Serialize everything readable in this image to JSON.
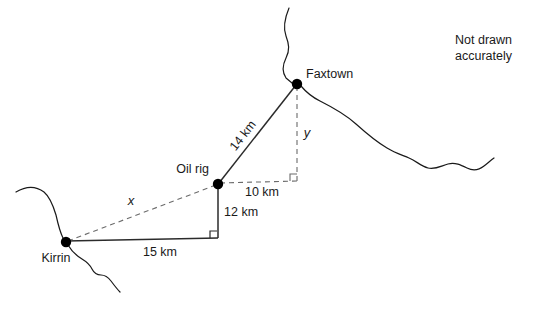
{
  "figure": {
    "note": {
      "line1": "Not drawn",
      "line2": "accurately"
    },
    "places": [
      {
        "id": "faxtown",
        "label": "Faxtown",
        "x": 297,
        "y": 84
      },
      {
        "id": "oil-rig",
        "label": "Oil rig",
        "x": 218,
        "y": 184
      },
      {
        "id": "kirrin",
        "label": "Kirrin",
        "x": 66,
        "y": 242
      }
    ],
    "measurements": [
      {
        "id": "oilrig-faxtown",
        "label": "14 km",
        "value": 14,
        "unit": "km",
        "style": "solid",
        "from": "oil-rig",
        "to": "faxtown"
      },
      {
        "id": "oilrig-horizontal",
        "label": "10 km",
        "value": 10,
        "unit": "km",
        "style": "dashed",
        "from": "oil-rig",
        "to": "corner-upper"
      },
      {
        "id": "oilrig-vertical",
        "label": "12 km",
        "value": 12,
        "unit": "km",
        "style": "solid",
        "from": "oil-rig",
        "to": "corner-lower"
      },
      {
        "id": "kirrin-base",
        "label": "15 km",
        "value": 15,
        "unit": "km",
        "style": "solid",
        "from": "kirrin",
        "to": "corner-lower"
      }
    ],
    "unknowns": [
      {
        "id": "x",
        "label": "x",
        "style": "dashed",
        "from": "kirrin",
        "to": "oil-rig"
      },
      {
        "id": "y",
        "label": "y",
        "style": "dashed",
        "from": "faxtown",
        "to": "corner-upper"
      }
    ],
    "colors": {
      "ink": "#1a1a1a",
      "solid_line": "#2b2b2b",
      "dashed_line": "#6b6b6b",
      "node": "#000000",
      "background": "#ffffff"
    }
  }
}
